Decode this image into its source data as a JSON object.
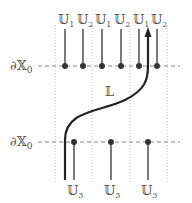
{
  "diagram": {
    "boundary_label_top": "∂𝕏",
    "boundary_label_top_sub": "0",
    "boundary_label_bottom": "∂𝕏",
    "boundary_label_bottom_sub": "0",
    "curve_label": "𝕃",
    "top_labels": [
      {
        "base": "𝕌",
        "sub": "1"
      },
      {
        "base": "𝕌",
        "sub": "2"
      },
      {
        "base": "𝕌",
        "sub": "1"
      },
      {
        "base": "𝕌",
        "sub": "2"
      },
      {
        "base": "𝕌",
        "sub": "1"
      },
      {
        "base": "𝕌",
        "sub": "2"
      }
    ],
    "bottom_labels": [
      {
        "base": "𝕌",
        "sub": "3"
      },
      {
        "base": "𝕌",
        "sub": "3"
      },
      {
        "base": "𝕌",
        "sub": "3"
      }
    ],
    "colors": {
      "line": "#333333",
      "curve": "#222222",
      "dashed": "#888888",
      "dotted": "#bbbbbb",
      "text": "#555555"
    }
  }
}
